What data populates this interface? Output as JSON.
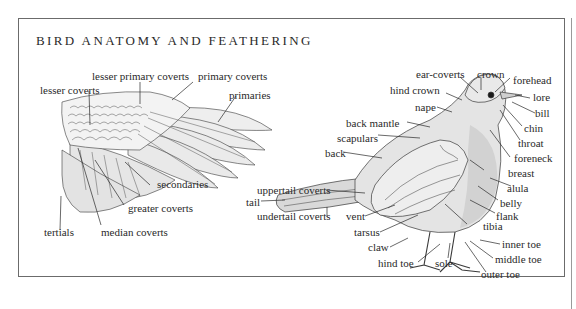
{
  "title": "BIRD ANATOMY AND FEATHERING",
  "wing_labels": {
    "lesser_primary_coverts": "lesser primary coverts",
    "primary_coverts": "primary coverts",
    "lesser_coverts": "lesser coverts",
    "primaries": "primaries",
    "secondaries": "secondaries",
    "greater_coverts": "greater coverts",
    "tertials": "tertials",
    "median_coverts": "median coverts"
  },
  "bird_labels": {
    "ear_coverts": "ear-coverts",
    "crown": "crown",
    "forehead": "forehead",
    "hind_crown": "hind crown",
    "lore": "lore",
    "bill": "bill",
    "nape": "nape",
    "chin": "chin",
    "back_mantle": "back mantle",
    "throat": "throat",
    "scapulars": "scapulars",
    "foreneck": "foreneck",
    "back": "back",
    "breast": "breast",
    "uppertail_coverts": "uppertail coverts",
    "alula": "alula",
    "belly": "belly",
    "tail": "tail",
    "undertail_coverts": "undertail coverts",
    "vent": "vent",
    "flank": "flank",
    "tibia": "tibia",
    "tarsus": "tarsus",
    "claw": "claw",
    "inner_toe": "inner toe",
    "middle_toe": "middle toe",
    "hind_toe": "hind toe",
    "sole": "sole",
    "outer_toe": "outer toe"
  },
  "colors": {
    "frame_border": "#6b6b6b",
    "ink": "#2a2a2a",
    "feather_fill": "#ececec",
    "body_shade": "#d6d6d6"
  }
}
